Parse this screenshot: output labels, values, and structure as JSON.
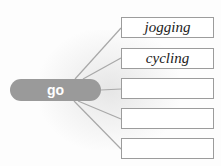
{
  "center": {
    "label": "go",
    "color": "#9a9a9a"
  },
  "answers": [
    {
      "text": "jogging"
    },
    {
      "text": "cycling"
    },
    {
      "text": ""
    },
    {
      "text": ""
    },
    {
      "text": ""
    }
  ],
  "colors": {
    "line": "#a8a8a8",
    "box_border": "#9c9c9c"
  }
}
